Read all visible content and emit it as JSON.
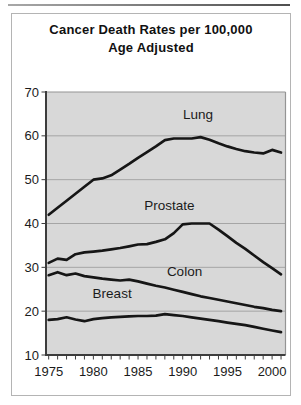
{
  "title": {
    "line1": "Cancer Death Rates per 100,000",
    "line2": "Age Adjusted"
  },
  "colors": {
    "line": "#161616",
    "plot_background": "#d8d8d8",
    "gridline": "#a5a5a5",
    "axis_dark": "#3d3d3d",
    "axis_light": "#949494",
    "frame_border": "#b4b4b4",
    "scan_artifact": "#5a5a5a",
    "text": "#1b1b1b"
  },
  "chart_data": {
    "type": "line",
    "title": "Cancer Death Rates per 100,000 Age Adjusted",
    "xlabel": "",
    "ylabel": "",
    "xlim": [
      1974.7,
      2001.5
    ],
    "ylim": [
      10,
      70
    ],
    "grid": "horizontal-only",
    "legend": "inline-labels",
    "x": [
      1975,
      1976,
      1977,
      1978,
      1979,
      1980,
      1981,
      1982,
      1983,
      1984,
      1985,
      1986,
      1987,
      1988,
      1989,
      1990,
      1991,
      1992,
      1993,
      1994,
      1995,
      1996,
      1997,
      1998,
      1999,
      2000,
      2001
    ],
    "x_tick_years": [
      1975,
      1980,
      1985,
      1990,
      1995,
      2000
    ],
    "x_tick_labels": [
      "1975",
      "1980",
      "1985",
      "1990",
      "1995",
      "2000"
    ],
    "y_ticks": [
      10,
      20,
      30,
      40,
      50,
      60,
      70
    ],
    "y_tick_labels": [
      "10",
      "20",
      "30",
      "40",
      "50",
      "60",
      "70"
    ],
    "series": [
      {
        "name": "Lung",
        "values": [
          42.0,
          43.6,
          45.2,
          46.8,
          48.4,
          50.0,
          50.3,
          51.0,
          52.3,
          53.6,
          55.0,
          56.3,
          57.6,
          59.0,
          59.4,
          59.4,
          59.4,
          59.7,
          59.1,
          58.3,
          57.6,
          57.0,
          56.5,
          56.2,
          56.0,
          56.8,
          56.2
        ],
        "label_anchor": {
          "x": 1991.7,
          "y": 65.0
        }
      },
      {
        "name": "Prostate",
        "values": [
          31.0,
          32.0,
          31.7,
          33.0,
          33.4,
          33.6,
          33.8,
          34.1,
          34.4,
          34.8,
          35.2,
          35.3,
          35.8,
          36.4,
          37.8,
          39.8,
          40.0,
          40.0,
          40.0,
          38.6,
          37.1,
          35.6,
          34.2,
          32.7,
          31.2,
          29.8,
          28.4
        ],
        "label_anchor": {
          "x": 1988.5,
          "y": 44.2
        }
      },
      {
        "name": "Colon",
        "values": [
          28.2,
          28.9,
          28.2,
          28.6,
          28.0,
          27.7,
          27.4,
          27.2,
          27.0,
          27.2,
          26.8,
          26.3,
          25.8,
          25.4,
          24.9,
          24.4,
          23.9,
          23.4,
          23.0,
          22.6,
          22.2,
          21.8,
          21.4,
          21.0,
          20.7,
          20.3,
          20.0
        ],
        "label_anchor": {
          "x": 1990.2,
          "y": 29.2
        }
      },
      {
        "name": "Breast",
        "values": [
          18.0,
          18.2,
          18.6,
          18.1,
          17.7,
          18.2,
          18.4,
          18.6,
          18.7,
          18.8,
          18.9,
          18.9,
          19.0,
          19.3,
          19.1,
          18.9,
          18.6,
          18.3,
          18.0,
          17.7,
          17.4,
          17.1,
          16.8,
          16.4,
          16.0,
          15.6,
          15.2
        ],
        "label_anchor": {
          "x": 1982.1,
          "y": 24.1
        }
      }
    ]
  }
}
